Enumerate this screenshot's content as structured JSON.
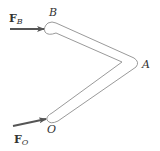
{
  "diagram": {
    "points": {
      "B": {
        "label": "B"
      },
      "A": {
        "label": "A"
      },
      "O": {
        "label": "O"
      }
    },
    "forces": {
      "F_B": {
        "symbol": "F",
        "subscript": "B"
      },
      "F_O": {
        "symbol": "F",
        "subscript": "O"
      }
    },
    "colors": {
      "bar_outline": "#9a9a9a",
      "arrow": "#555555",
      "text": "#333333"
    }
  }
}
